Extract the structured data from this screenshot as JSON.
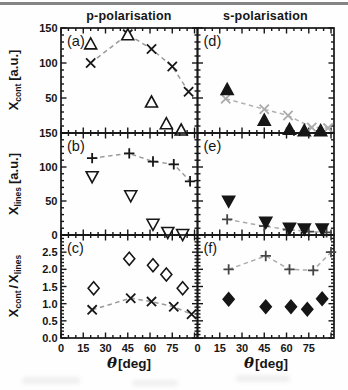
{
  "page": {
    "background": "#fefefe",
    "top_rule_color": "#6f6f6f"
  },
  "chart_data": {
    "type": "scatter",
    "grid": "3 rows x 2 columns, shared axes, ticks inside on all sides",
    "columns": [
      {
        "id": "left",
        "title": "p-polarisation"
      },
      {
        "id": "right",
        "title": "s-polarisation"
      }
    ],
    "x_axis": {
      "title_theta": "θ",
      "title_unit": "[deg]",
      "lim": [
        0,
        92
      ],
      "major_ticks": [
        0,
        15,
        30,
        45,
        60,
        75,
        90
      ],
      "minor_step": 5,
      "labels": [
        {
          "v": 0,
          "t": "0"
        },
        {
          "v": 15,
          "t": "15"
        },
        {
          "v": 30,
          "t": "30"
        },
        {
          "v": 45,
          "t": "45"
        },
        {
          "v": 60,
          "t": "60"
        },
        {
          "v": 75,
          "t": "75"
        }
      ]
    },
    "rows": [
      {
        "id": 1,
        "ylabel": {
          "base": "X",
          "sub": "cont",
          "rest": "[a.u.]"
        },
        "lim": [
          0,
          150
        ],
        "major_ticks": [
          0,
          50,
          100,
          150
        ],
        "minor_step": 10,
        "labels": [
          {
            "v": 50,
            "t": "50"
          },
          {
            "v": 100,
            "t": "100"
          },
          {
            "v": 150,
            "t": "150"
          }
        ]
      },
      {
        "id": 2,
        "ylabel": {
          "base": "X",
          "sub": "lines",
          "rest": "[a.u.]"
        },
        "lim": [
          0,
          150
        ],
        "major_ticks": [
          0,
          50,
          100,
          150
        ],
        "minor_step": 10,
        "labels": [
          {
            "v": 0,
            "t": "0"
          },
          {
            "v": 50,
            "t": "50"
          },
          {
            "v": 100,
            "t": "100"
          },
          {
            "v": 150,
            "t": "150"
          }
        ]
      },
      {
        "id": 3,
        "ylabel": {
          "base1": "X",
          "sub1": "cont",
          "sep": "/",
          "base2": "X",
          "sub2": "lines"
        },
        "lim": [
          0,
          3
        ],
        "major_ticks": [
          0,
          0.5,
          1,
          1.5,
          2,
          2.5,
          3
        ],
        "minor_step": 0.1,
        "labels": [
          {
            "v": 0,
            "t": "0.0"
          },
          {
            "v": 0.5,
            "t": "0.5"
          },
          {
            "v": 1,
            "t": "1.0"
          },
          {
            "v": 1.5,
            "t": "1.5"
          },
          {
            "v": 2,
            "t": "2.0"
          },
          {
            "v": 2.5,
            "t": "2.5"
          }
        ]
      }
    ],
    "panels": [
      {
        "id": "a",
        "letter": "(a)",
        "column": "left",
        "row": 1,
        "series": [
          {
            "name": "x-cross-dashed",
            "marker": "x",
            "fill": "stroke",
            "marker_color": "#161616",
            "line": "dashed",
            "line_color": "#9a9a9a",
            "points": [
              [
                20,
                100
              ],
              [
                45,
                141
              ],
              [
                61,
                120
              ],
              [
                75,
                95
              ],
              [
                86,
                59
              ]
            ]
          },
          {
            "name": "triangle-up-open",
            "marker": "triangle-up",
            "fill": "open",
            "marker_color": "#161616",
            "line": "none",
            "line_color": null,
            "points": [
              [
                20,
                127
              ],
              [
                45,
                140
              ],
              [
                61,
                44
              ],
              [
                71,
                13
              ],
              [
                81,
                4
              ]
            ]
          }
        ]
      },
      {
        "id": "d",
        "letter": "(d)",
        "column": "right",
        "row": 1,
        "series": [
          {
            "name": "x-cross-dashed-gray",
            "marker": "x",
            "fill": "stroke",
            "marker_color": "#ababab",
            "line": "dashed",
            "line_color": "#b2b2b2",
            "points": [
              [
                19,
                49
              ],
              [
                45,
                34
              ],
              [
                61,
                25
              ],
              [
                77,
                8
              ],
              [
                88,
                7
              ]
            ]
          },
          {
            "name": "triangle-up-filled",
            "marker": "triangle-up",
            "fill": "filled",
            "marker_color": "#161616",
            "line": "none",
            "line_color": null,
            "points": [
              [
                20,
                62
              ],
              [
                45,
                18
              ],
              [
                62,
                5
              ],
              [
                72,
                3
              ],
              [
                83,
                3
              ]
            ]
          }
        ]
      },
      {
        "id": "b",
        "letter": "(b)",
        "column": "left",
        "row": 2,
        "series": [
          {
            "name": "plus-dashed",
            "marker": "plus",
            "fill": "stroke",
            "marker_color": "#161616",
            "line": "dashed",
            "line_color": "#9a9a9a",
            "points": [
              [
                21,
                113
              ],
              [
                46,
                120
              ],
              [
                62,
                108
              ],
              [
                76,
                104
              ],
              [
                87,
                79
              ]
            ]
          },
          {
            "name": "triangle-down-open",
            "marker": "triangle-down",
            "fill": "open",
            "marker_color": "#161616",
            "line": "none",
            "line_color": null,
            "points": [
              [
                21,
                86
              ],
              [
                47,
                58
              ],
              [
                62,
                16
              ],
              [
                72,
                4
              ],
              [
                82,
                1
              ]
            ]
          }
        ]
      },
      {
        "id": "e",
        "letter": "(e)",
        "column": "right",
        "row": 2,
        "series": [
          {
            "name": "plus-dashed",
            "marker": "plus",
            "fill": "stroke",
            "marker_color": "#454545",
            "line": "dashed",
            "line_color": "#aaaaaa",
            "points": [
              [
                20,
                23
              ],
              [
                45,
                13
              ],
              [
                61,
                8
              ],
              [
                75,
                5
              ],
              [
                87,
                4
              ]
            ]
          },
          {
            "name": "triangle-down-filled",
            "marker": "triangle-down",
            "fill": "filled",
            "marker_color": "#161616",
            "line": "none",
            "line_color": null,
            "points": [
              [
                21,
                50
              ],
              [
                46,
                19
              ],
              [
                62,
                10
              ],
              [
                72,
                9
              ],
              [
                84,
                9
              ]
            ]
          }
        ]
      },
      {
        "id": "c",
        "letter": "(c)",
        "column": "left",
        "row": 3,
        "series": [
          {
            "name": "x-cross-dashed",
            "marker": "x",
            "fill": "stroke",
            "marker_color": "#161616",
            "line": "dashed",
            "line_color": "#9a9a9a",
            "points": [
              [
                21,
                0.82
              ],
              [
                47,
                1.16
              ],
              [
                61,
                1.06
              ],
              [
                76,
                0.91
              ],
              [
                88,
                0.69
              ]
            ]
          },
          {
            "name": "diamond-open",
            "marker": "diamond",
            "fill": "open",
            "marker_color": "#161616",
            "line": "none",
            "line_color": null,
            "points": [
              [
                22,
                1.45
              ],
              [
                46,
                2.31
              ],
              [
                62,
                2.12
              ],
              [
                71,
                1.85
              ],
              [
                82,
                1.45
              ]
            ]
          }
        ]
      },
      {
        "id": "f",
        "letter": "(f)",
        "column": "right",
        "row": 3,
        "series": [
          {
            "name": "plus-dashed",
            "marker": "plus",
            "fill": "stroke",
            "marker_color": "#454545",
            "line": "dashed",
            "line_color": "#aaaaaa",
            "points": [
              [
                21,
                2.0
              ],
              [
                46,
                2.39
              ],
              [
                62,
                2.0
              ],
              [
                78,
                1.97
              ],
              [
                90,
                2.5
              ]
            ]
          },
          {
            "name": "diamond-filled",
            "marker": "diamond",
            "fill": "filled",
            "marker_color": "#161616",
            "line": "none",
            "line_color": null,
            "points": [
              [
                21,
                1.13
              ],
              [
                46,
                0.91
              ],
              [
                63,
                0.91
              ],
              [
                74,
                0.84
              ],
              [
                84,
                1.14
              ]
            ]
          }
        ]
      }
    ]
  }
}
